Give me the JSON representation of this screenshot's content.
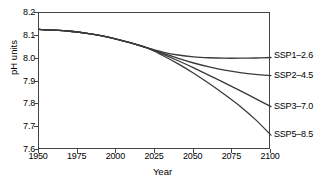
{
  "chart_data": {
    "type": "line",
    "title": "",
    "xlabel": "Year",
    "ylabel": "pH units",
    "xlim": [
      1950,
      2100
    ],
    "ylim": [
      7.6,
      8.2
    ],
    "grid": false,
    "legend_position": "right-outside-line-end",
    "xticks": [
      1950,
      1975,
      2000,
      2025,
      2050,
      2075,
      2100
    ],
    "xtick_labels": [
      "1950",
      "1975",
      "2000",
      "2025",
      "2050",
      "2075",
      "2100"
    ],
    "yticks": [
      7.6,
      7.7,
      7.8,
      7.9,
      8.0,
      8.1,
      8.2
    ],
    "ytick_labels": [
      "7.6",
      "7.7",
      "7.8",
      "7.9",
      "8.0",
      "8.1",
      "8.2"
    ],
    "line_color": "#3a3a3a",
    "line_width": 1.3,
    "x": [
      1950,
      1960,
      1970,
      1980,
      1990,
      2000,
      2010,
      2020,
      2030,
      2040,
      2050,
      2060,
      2070,
      2080,
      2090,
      2100
    ],
    "series": [
      {
        "name": "SSP1-2.6",
        "label": "SSP1–2.6",
        "label_value_y": 8.01,
        "values": [
          8.128,
          8.125,
          8.12,
          8.112,
          8.101,
          8.086,
          8.068,
          8.047,
          8.029,
          8.016,
          8.008,
          8.004,
          8.002,
          8.002,
          8.003,
          8.005
        ]
      },
      {
        "name": "SSP2-4.5",
        "label": "SSP2–4.5",
        "label_value_y": 7.925,
        "values": [
          8.128,
          8.125,
          8.12,
          8.112,
          8.101,
          8.086,
          8.068,
          8.047,
          8.024,
          8.001,
          7.981,
          7.964,
          7.95,
          7.939,
          7.931,
          7.926
        ]
      },
      {
        "name": "SSP3-7.0",
        "label": "SSP3–7.0",
        "label_value_y": 7.79,
        "values": [
          8.128,
          8.125,
          8.12,
          8.112,
          8.101,
          8.086,
          8.068,
          8.047,
          8.02,
          7.991,
          7.96,
          7.927,
          7.894,
          7.86,
          7.825,
          7.79
        ]
      },
      {
        "name": "SSP5-8.5",
        "label": "SSP5–8.5",
        "label_value_y": 7.665,
        "values": [
          8.128,
          8.125,
          8.12,
          8.112,
          8.101,
          8.086,
          8.068,
          8.047,
          8.014,
          7.977,
          7.936,
          7.891,
          7.843,
          7.792,
          7.733,
          7.665
        ]
      }
    ]
  }
}
